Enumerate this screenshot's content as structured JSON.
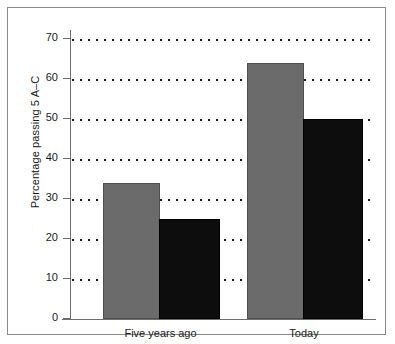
{
  "chart_data": {
    "type": "bar",
    "title": "",
    "xlabel": "",
    "ylabel": "Percentage passing 5 A–C",
    "categories": [
      "Five years ago",
      "Today"
    ],
    "series": [
      {
        "name": "series-1-gray",
        "color": "#6b6b6b",
        "values": [
          34,
          64
        ]
      },
      {
        "name": "series-2-black",
        "color": "#0d0d0d",
        "values": [
          25,
          50
        ]
      }
    ],
    "ylim": [
      0,
      70
    ],
    "ytick_labels": [
      "0",
      "10",
      "20",
      "30",
      "40",
      "50",
      "60",
      "70"
    ],
    "ytick_values": [
      0,
      10,
      20,
      30,
      40,
      50,
      60,
      70
    ],
    "grid": true,
    "grid_style": "dotted",
    "legend": "none",
    "frame": true
  }
}
